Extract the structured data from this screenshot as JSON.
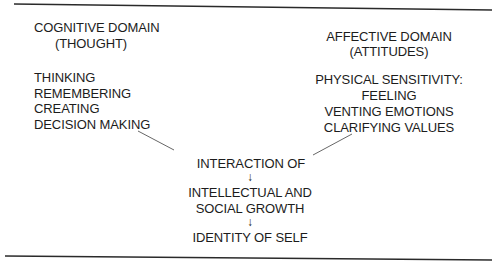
{
  "cognitive": {
    "title": "COGNITIVE DOMAIN",
    "subtitle": "(THOUGHT)",
    "items": [
      "THINKING",
      "REMEMBERING",
      "CREATING",
      "DECISION MAKING"
    ]
  },
  "affective": {
    "title": "AFFECTIVE DOMAIN",
    "subtitle": "(ATTITUDES)",
    "items": [
      "PHYSICAL SENSITIVITY:",
      "FEELING",
      "VENTING EMOTIONS",
      "CLARIFYING VALUES"
    ]
  },
  "flow": {
    "steps": [
      "INTERACTION OF",
      "INTELLECTUAL AND",
      "SOCIAL GROWTH",
      "IDENTITY OF SELF"
    ],
    "arrow": "↓"
  },
  "colors": {
    "text": "#1c1c1c",
    "rule": "#2a2a2a",
    "connector": "#555555"
  }
}
